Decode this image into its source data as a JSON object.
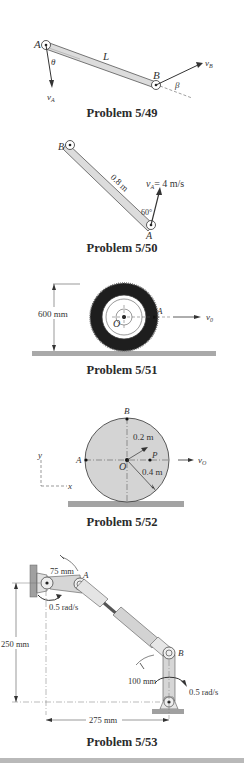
{
  "problems": [
    {
      "id": "5/49",
      "caption": "Problem 5/49",
      "labels": {
        "point_a": "A",
        "point_b": "B",
        "length": "L",
        "angle_theta": "θ",
        "angle_beta": "β",
        "velocity_a": "v",
        "velocity_a_sub": "A",
        "velocity_b": "v",
        "velocity_b_sub": "B"
      }
    },
    {
      "id": "5/50",
      "caption": "Problem 5/50",
      "labels": {
        "point_a": "A",
        "point_b": "B",
        "length": "0.8 m",
        "velocity": "v",
        "velocity_sub": "A",
        "velocity_value": "= 4 m/s",
        "angle": "60°"
      }
    },
    {
      "id": "5/51",
      "caption": "Problem 5/51",
      "labels": {
        "height": "600 mm",
        "center": "O",
        "point_a": "A",
        "velocity": "v",
        "velocity_sub": "0"
      }
    },
    {
      "id": "5/52",
      "caption": "Problem 5/52",
      "labels": {
        "point_a": "A",
        "point_b": "B",
        "center": "O",
        "point_p": "P",
        "inner_radius": "0.2 m",
        "outer_radius": "0.4 m",
        "velocity": "v",
        "velocity_sub": "O",
        "axis_x": "x",
        "axis_y": "y"
      }
    },
    {
      "id": "5/53",
      "caption": "Problem 5/53",
      "labels": {
        "crank_length": "75 mm",
        "point_a": "A",
        "point_b": "B",
        "omega_top": "0.5 rad/s",
        "omega_bottom": "0.5 rad/s",
        "vertical_dim": "250 mm",
        "lower_link": "100 mm",
        "horizontal_dim": "275 mm"
      }
    }
  ],
  "colors": {
    "link_fill": "#d9d9d9",
    "ground": "#a9a9a9",
    "disk_fill": "#d4d4d4",
    "line": "#333333"
  }
}
